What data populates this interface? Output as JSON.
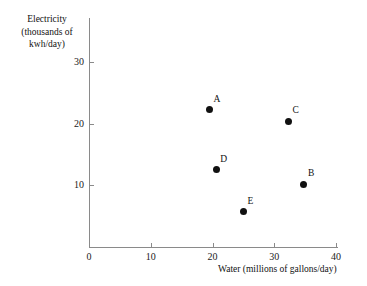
{
  "top_artifact_text": "",
  "chart_data": {
    "type": "scatter",
    "title": "",
    "xlabel": "Water (millions of gallons/day)",
    "ylabel_lines": [
      "Electricity",
      "(thousands of",
      "kwh/day)"
    ],
    "ylabel": "Electricity (thousands of kwh/day)",
    "xlim": [
      0,
      40
    ],
    "ylim": [
      0,
      32
    ],
    "xticks": [
      0,
      10,
      20,
      30,
      40
    ],
    "xtick_labels": [
      "0",
      "10",
      "20",
      "30",
      "40"
    ],
    "yticks": [
      10,
      20,
      30
    ],
    "ytick_labels": [
      "10",
      "20",
      "30"
    ],
    "grid": false,
    "legend": "none",
    "point_color": "#111111",
    "axis_color": "#8a8a8a",
    "points": [
      {
        "label": "A",
        "x": 19.5,
        "y": 22.2
      },
      {
        "label": "B",
        "x": 34.8,
        "y": 10.2
      },
      {
        "label": "C",
        "x": 32.3,
        "y": 20.4
      },
      {
        "label": "D",
        "x": 20.6,
        "y": 12.5
      },
      {
        "label": "E",
        "x": 25.0,
        "y": 5.7
      }
    ]
  }
}
